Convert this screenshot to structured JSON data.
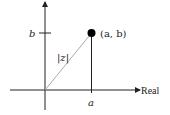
{
  "diagram": {
    "type": "complex-plane",
    "point_label": "(a, b)",
    "b_label": "b",
    "a_label": "a",
    "modulus_label": "|z|",
    "real_axis_label": "Real",
    "colors": {
      "axis": "#222222",
      "modulus_line": "#aaaaaa",
      "point": "#000000"
    }
  }
}
